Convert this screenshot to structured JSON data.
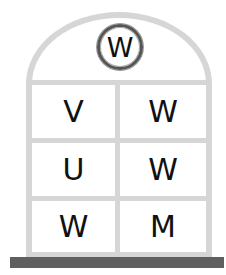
{
  "emblem": {
    "letter": "W"
  },
  "grid": {
    "rows": [
      [
        "V",
        "W"
      ],
      [
        "U",
        "W"
      ],
      [
        "W",
        "M"
      ]
    ]
  },
  "colors": {
    "frame": "#d6d6d6",
    "base": "#5f5f5f",
    "text": "#111111"
  }
}
